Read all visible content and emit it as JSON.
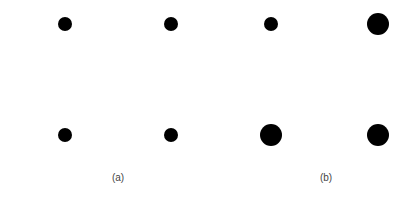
{
  "panels": [
    {
      "label": "(a)",
      "label_pos": [
        118,
        177
      ],
      "dots": [
        {
          "x": 65,
          "y": 24,
          "d": 14
        },
        {
          "x": 171,
          "y": 24,
          "d": 14
        },
        {
          "x": 65,
          "y": 135,
          "d": 14
        },
        {
          "x": 171,
          "y": 135,
          "d": 14
        }
      ]
    },
    {
      "label": "(b)",
      "label_pos": [
        326,
        177
      ],
      "dots": [
        {
          "x": 271,
          "y": 24,
          "d": 14
        },
        {
          "x": 378,
          "y": 24,
          "d": 22
        },
        {
          "x": 271,
          "y": 135,
          "d": 22
        },
        {
          "x": 378,
          "y": 135,
          "d": 22
        }
      ]
    }
  ],
  "colors": {
    "dot": "#000000",
    "label": "#444444",
    "background": "#ffffff"
  }
}
